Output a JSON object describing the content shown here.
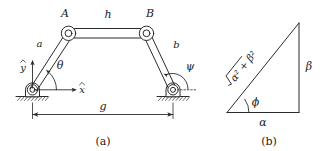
{
  "figure": {
    "background_color": "#ffffff",
    "ink_color": "#2b2b2b",
    "panels": [
      {
        "id": "a",
        "caption": "(a)",
        "description": "four-bar linkage mechanism"
      },
      {
        "id": "b",
        "caption": "(b)",
        "description": "right triangle"
      }
    ]
  },
  "panel_a": {
    "caption": "(a)",
    "joint_labels": {
      "top_left": "A",
      "top_right": "B"
    },
    "link_labels": {
      "left_link": "a",
      "top_link": "h",
      "right_link": "b"
    },
    "angle_labels": {
      "left_angle": "θ",
      "right_angle": "ψ"
    },
    "axis_labels": {
      "y_axis": "y",
      "y_axis_hat": "̂",
      "x_axis": "x",
      "x_axis_hat": "̂"
    },
    "dimension_labels": {
      "ground_span": "g"
    }
  },
  "panel_b": {
    "caption": "(b)",
    "side_labels": {
      "hypotenuse_radicand": "α² + β²",
      "hypotenuse_display": "√(α² + β²)",
      "vertical_side": "β",
      "horizontal_side": "α"
    },
    "angle_labels": {
      "base_angle": "ϕ"
    }
  }
}
